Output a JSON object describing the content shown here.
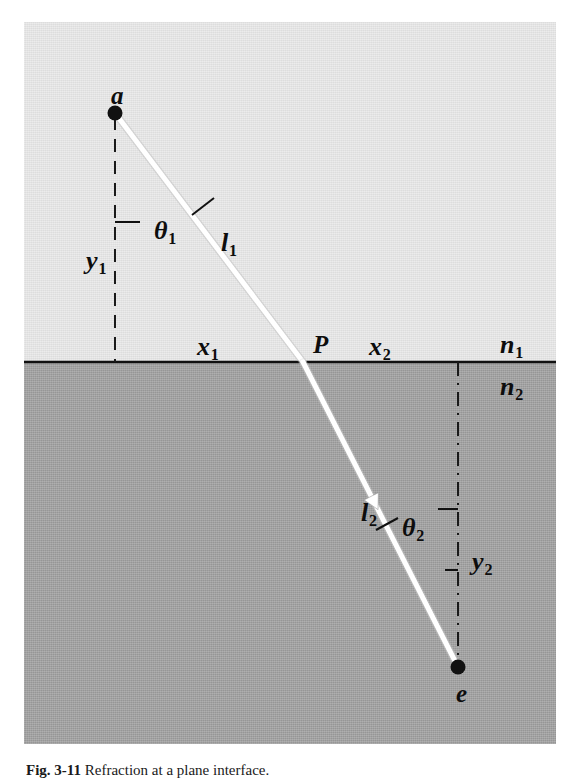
{
  "figure": {
    "caption_prefix": "Fig. 3-11",
    "caption_text": "Refraction at a plane interface.",
    "colors": {
      "medium_upper": "#e8e8e8",
      "medium_lower": "#9d9d9d",
      "ray": "#ffffff",
      "ink": "#0d0d0d",
      "page": "#ffffff"
    },
    "points": [
      {
        "id": "a",
        "label": "a",
        "x": 91,
        "y": 91,
        "label_dx": -4,
        "label_dy": -30
      },
      {
        "id": "P",
        "label": "P",
        "x": 279,
        "y": 340,
        "label_dx": 10,
        "label_dy": -30
      },
      {
        "id": "e",
        "label": "e",
        "x": 434,
        "y": 645,
        "label_dx": -2,
        "label_dy": 14
      }
    ],
    "labels": [
      {
        "id": "theta1",
        "base": "θ",
        "sub": "1",
        "x": 130,
        "y": 196,
        "size": "sz-th",
        "italic": true
      },
      {
        "id": "theta2",
        "base": "θ",
        "sub": "2",
        "x": 378,
        "y": 493,
        "size": "sz-th",
        "italic": true
      },
      {
        "id": "y1",
        "base": "y",
        "sub": "1",
        "x": 62,
        "y": 226,
        "size": "sz-var",
        "italic": true
      },
      {
        "id": "y2",
        "base": "y",
        "sub": "2",
        "x": 448,
        "y": 527,
        "size": "sz-var",
        "italic": true
      },
      {
        "id": "l1",
        "base": "l",
        "sub": "1",
        "x": 197,
        "y": 208,
        "size": "sz-var",
        "italic": true
      },
      {
        "id": "l2",
        "base": "l",
        "sub": "2",
        "x": 337,
        "y": 478,
        "size": "sz-var",
        "italic": true
      },
      {
        "id": "x1",
        "base": "x",
        "sub": "1",
        "x": 173,
        "y": 312,
        "size": "sz-var",
        "italic": true
      },
      {
        "id": "x2",
        "base": "x",
        "sub": "2",
        "x": 345,
        "y": 312,
        "size": "sz-var",
        "italic": true
      },
      {
        "id": "n1",
        "base": "n",
        "sub": "1",
        "x": 476,
        "y": 310,
        "size": "sz-var",
        "italic": true
      },
      {
        "id": "n2",
        "base": "n",
        "sub": "2",
        "x": 476,
        "y": 352,
        "size": "sz-var",
        "italic": true
      }
    ],
    "geometry": {
      "interface_y": 340,
      "normal_upper_x": 91,
      "normal_lower_x": 434,
      "ray_incident": {
        "x1": 91,
        "y1": 91,
        "x2": 279,
        "y2": 340
      },
      "ray_refracted": {
        "x1": 279,
        "y1": 340,
        "x2": 434,
        "y2": 645
      },
      "arrow_t": 0.46
    }
  }
}
